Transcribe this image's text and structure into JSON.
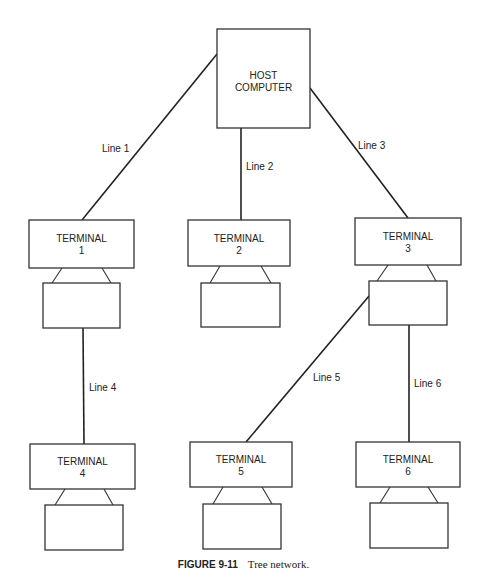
{
  "host": {
    "line1": "HOST",
    "line2": "COMPUTER"
  },
  "terminals": [
    {
      "id": "t1",
      "name": "TERMINAL",
      "number": "1"
    },
    {
      "id": "t2",
      "name": "TERMINAL",
      "number": "2"
    },
    {
      "id": "t3",
      "name": "TERMINAL",
      "number": "3"
    },
    {
      "id": "t4",
      "name": "TERMINAL",
      "number": "4"
    },
    {
      "id": "t5",
      "name": "TERMINAL",
      "number": "5"
    },
    {
      "id": "t6",
      "name": "TERMINAL",
      "number": "6"
    }
  ],
  "links": [
    {
      "label": "Line 1",
      "from": "host",
      "to": "t1"
    },
    {
      "label": "Line 2",
      "from": "host",
      "to": "t2"
    },
    {
      "label": "Line 3",
      "from": "host",
      "to": "t3"
    },
    {
      "label": "Line 4",
      "from": "t1",
      "to": "t4"
    },
    {
      "label": "Line 5",
      "from": "t3",
      "to": "t5"
    },
    {
      "label": "Line 6",
      "from": "t3",
      "to": "t6"
    }
  ],
  "caption": {
    "number": "FIGURE 9-11",
    "text": "Tree network."
  }
}
